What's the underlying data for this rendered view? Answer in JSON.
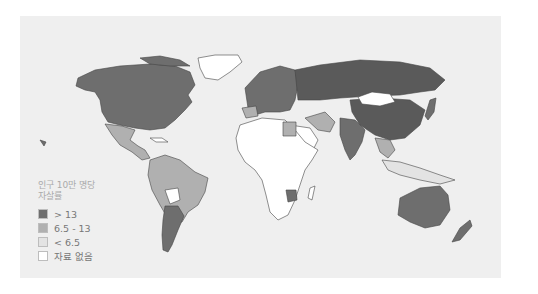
{
  "map": {
    "title": "인구 10만 명당 자살률",
    "title_lines": [
      "인구 10만 명당",
      "자살률"
    ],
    "colors": {
      "high": "#6e6e6e",
      "medium": "#b0b0b0",
      "low": "#e3e3e3",
      "no_data": "#ffffff",
      "background": "#efefef",
      "border": "#555555"
    },
    "legend": [
      {
        "label": "> 13",
        "color": "#6e6e6e"
      },
      {
        "label": "6.5 - 13",
        "color": "#b0b0b0"
      },
      {
        "label": "< 6.5",
        "color": "#e3e3e3"
      },
      {
        "label": "자료 없음",
        "color": "#ffffff"
      }
    ],
    "regions": [
      {
        "name": "North America (US/Canada)",
        "class": "> 13"
      },
      {
        "name": "Greenland",
        "class": "자료 없음"
      },
      {
        "name": "Mexico/Central America",
        "class": "6.5 - 13"
      },
      {
        "name": "South America (Brazil etc.)",
        "class": "6.5 - 13"
      },
      {
        "name": "Argentina/Uruguay",
        "class": "> 13"
      },
      {
        "name": "Bolivia",
        "class": "자료 없음"
      },
      {
        "name": "Europe",
        "class": "> 13"
      },
      {
        "name": "Russia",
        "class": "> 13"
      },
      {
        "name": "China",
        "class": "> 13"
      },
      {
        "name": "Mongolia",
        "class": "자료 없음"
      },
      {
        "name": "India",
        "class": "> 13"
      },
      {
        "name": "Africa",
        "class": "자료 없음"
      },
      {
        "name": "Egypt",
        "class": "6.5 - 13"
      },
      {
        "name": "Zimbabwe",
        "class": "> 13"
      },
      {
        "name": "Iran/Middle East",
        "class": "6.5 - 13"
      },
      {
        "name": "Southeast Asia",
        "class": "6.5 - 13"
      },
      {
        "name": "Australia",
        "class": "> 13"
      },
      {
        "name": "New Zealand",
        "class": "> 13"
      }
    ]
  }
}
